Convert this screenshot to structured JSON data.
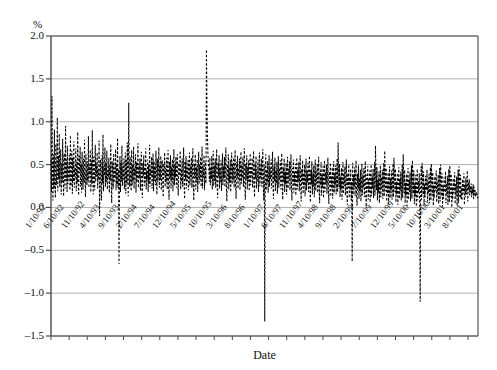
{
  "chart_data": {
    "type": "line",
    "title": "",
    "subtitle": "",
    "xlabel": "Date",
    "ylabel": "%",
    "ylim": [
      -1.5,
      2.0
    ],
    "y_ticks": [
      "2.0",
      "1.5",
      "1.0",
      "0.5",
      "0.0",
      "–0.5",
      "–1.0",
      "–1.5"
    ],
    "y_tick_values": [
      2.0,
      1.5,
      1.0,
      0.5,
      0.0,
      -0.5,
      -1.0,
      -1.5
    ],
    "grid": true,
    "grid_axis": "y",
    "legend": "none",
    "line_style": "dashed",
    "line_color": "#000000",
    "series_name": "",
    "x_tick_labels": [
      "1/10/92",
      "6/10/92",
      "11/10/92",
      "4/10/93",
      "9/10/93",
      "2/10/94",
      "7/10/94",
      "12/10/94",
      "5/10/95",
      "10/10/95",
      "3/10/96",
      "8/10/96",
      "1/10/97",
      "6/10/97",
      "11/10/97",
      "4/10/98",
      "9/10/98",
      "2/10/99",
      "7/10/99",
      "12/10/99",
      "5/10/00",
      "10/10/00",
      "3/10/01",
      "8/10/01"
    ],
    "x_tick_interval_months": 5,
    "x_range": [
      "1/10/92",
      "12/10/01"
    ],
    "n_points": 1180,
    "annotations": [
      {
        "label": "peak spike",
        "x": "3/10/96",
        "y": 1.85
      },
      {
        "label": "deep trough",
        "x": "4/10/98",
        "y": -1.33
      },
      {
        "label": "deep trough",
        "x": "3/10/01",
        "y": -1.1
      }
    ],
    "values": [
      0.55,
      0.18,
      1.3,
      0.36,
      0.08,
      0.62,
      0.22,
      0.91,
      0.3,
      0.11,
      0.74,
      0.26,
      0.44,
      1.05,
      0.19,
      0.6,
      0.33,
      0.86,
      0.24,
      0.47,
      0.68,
      0.15,
      0.52,
      0.29,
      0.8,
      0.36,
      0.13,
      0.63,
      0.41,
      0.22,
      0.95,
      0.31,
      0.56,
      0.18,
      0.72,
      0.27,
      0.49,
      0.34,
      0.61,
      0.2,
      0.84,
      0.25,
      0.43,
      0.66,
      0.16,
      0.58,
      0.3,
      0.77,
      0.23,
      0.46,
      0.35,
      0.69,
      0.19,
      0.53,
      0.28,
      0.88,
      0.32,
      0.14,
      0.6,
      0.4,
      0.71,
      0.24,
      0.5,
      0.17,
      0.65,
      0.37,
      0.21,
      0.57,
      0.29,
      0.79,
      0.33,
      0.12,
      0.62,
      0.42,
      0.26,
      0.54,
      0.31,
      0.83,
      0.23,
      0.48,
      0.38,
      0.67,
      0.18,
      0.55,
      0.27,
      0.9,
      0.34,
      0.15,
      0.59,
      0.44,
      0.2,
      0.73,
      0.3,
      0.51,
      0.36,
      0.64,
      0.22,
      0.45,
      0.32,
      0.78,
      -0.1,
      0.25,
      0.56,
      0.33,
      0.08,
      0.61,
      0.28,
      0.85,
      0.19,
      0.47,
      0.37,
      0.7,
      0.24,
      0.52,
      0.3,
      0.66,
      0.21,
      0.43,
      0.35,
      0.58,
      0.17,
      0.49,
      0.31,
      0.74,
      0.26,
      0.05,
      0.54,
      0.39,
      0.22,
      0.63,
      0.29,
      0.46,
      0.34,
      0.68,
      0.2,
      0.51,
      0.27,
      0.81,
      0.23,
      0.44,
      -0.66,
      0.36,
      0.6,
      0.18,
      0.53,
      0.3,
      0.72,
      0.25,
      0.48,
      0.33,
      0.57,
      0.21,
      0.42,
      0.64,
      0.16,
      0.55,
      0.28,
      0.76,
      0.32,
      0.13,
      1.22,
      0.45,
      0.24,
      0.59,
      0.35,
      0.19,
      0.67,
      0.26,
      0.5,
      0.31,
      0.71,
      0.22,
      0.46,
      0.38,
      0.62,
      0.17,
      0.53,
      0.29,
      0.4,
      0.75,
      0.23,
      0.48,
      0.34,
      0.57,
      0.2,
      0.44,
      0.65,
      0.27,
      0.11,
      0.52,
      0.36,
      0.61,
      0.25,
      0.47,
      0.3,
      0.69,
      0.21,
      0.43,
      0.33,
      0.56,
      0.18,
      0.5,
      0.28,
      0.73,
      0.24,
      0.45,
      0.37,
      0.59,
      0.22,
      0.41,
      0.63,
      0.19,
      0.54,
      0.31,
      0.48,
      0.26,
      0.66,
      0.35,
      0.15,
      0.57,
      0.29,
      0.44,
      0.7,
      0.23,
      0.49,
      0.32,
      0.6,
      0.2,
      0.42,
      0.55,
      0.27,
      0.12,
      0.51,
      0.38,
      0.64,
      0.24,
      0.46,
      0.3,
      0.58,
      0.21,
      0.43,
      0.67,
      0.25,
      0.09,
      0.53,
      0.34,
      0.61,
      0.22,
      0.47,
      0.31,
      0.56,
      0.19,
      0.4,
      0.68,
      0.26,
      0.5,
      0.35,
      0.59,
      0.23,
      0.44,
      0.62,
      0.28,
      0.14,
      0.52,
      0.37,
      0.48,
      0.66,
      0.21,
      0.45,
      0.3,
      0.57,
      0.24,
      0.41,
      0.7,
      0.27,
      0.1,
      0.54,
      0.33,
      0.6,
      0.22,
      0.46,
      0.31,
      0.55,
      0.2,
      0.42,
      0.64,
      0.26,
      0.49,
      0.36,
      0.58,
      0.23,
      0.44,
      0.69,
      0.25,
      0.08,
      0.51,
      0.34,
      0.62,
      0.21,
      0.47,
      0.29,
      0.56,
      0.18,
      0.43,
      0.65,
      0.27,
      0.5,
      0.32,
      0.59,
      0.24,
      0.45,
      0.71,
      0.22,
      0.48,
      0.35,
      0.61,
      0.2,
      0.42,
      0.53,
      0.28,
      1.84,
      1.2,
      0.86,
      0.63,
      0.52,
      0.44,
      0.3,
      0.58,
      0.26,
      0.47,
      0.33,
      0.6,
      0.21,
      0.43,
      0.66,
      0.25,
      0.49,
      0.31,
      0.57,
      0.23,
      0.45,
      0.68,
      0.27,
      0.11,
      0.52,
      0.36,
      0.61,
      0.22,
      0.46,
      0.3,
      0.55,
      0.19,
      0.41,
      0.63,
      0.26,
      0.48,
      0.34,
      0.59,
      0.24,
      0.44,
      0.7,
      0.25,
      0.07,
      0.5,
      0.33,
      0.62,
      0.21,
      0.47,
      0.29,
      0.56,
      0.18,
      0.43,
      0.64,
      0.27,
      0.51,
      0.32,
      0.58,
      0.23,
      0.45,
      0.67,
      0.26,
      0.1,
      0.53,
      0.35,
      0.6,
      0.22,
      0.46,
      0.31,
      0.57,
      0.2,
      0.42,
      0.65,
      0.28,
      0.49,
      0.34,
      0.59,
      0.24,
      0.44,
      0.69,
      0.25,
      0.09,
      0.51,
      0.33,
      0.61,
      0.21,
      0.47,
      0.3,
      0.55,
      0.19,
      0.4,
      0.63,
      0.26,
      0.48,
      0.36,
      0.58,
      0.23,
      0.43,
      0.66,
      0.27,
      0.12,
      0.52,
      0.34,
      0.6,
      0.22,
      0.45,
      0.31,
      0.56,
      0.18,
      0.41,
      0.64,
      0.25,
      0.49,
      0.35,
      0.57,
      0.24,
      0.46,
      0.68,
      0.26,
      0.08,
      0.5,
      -1.33,
      0.32,
      0.62,
      0.2,
      0.44,
      0.29,
      0.54,
      0.17,
      0.39,
      0.61,
      0.24,
      0.47,
      0.33,
      0.56,
      0.22,
      0.42,
      0.65,
      0.25,
      0.1,
      0.48,
      0.31,
      0.58,
      0.19,
      0.43,
      0.28,
      0.53,
      0.16,
      0.38,
      0.6,
      0.23,
      0.46,
      0.32,
      0.55,
      0.21,
      0.41,
      0.63,
      0.24,
      0.09,
      0.47,
      0.3,
      0.57,
      0.18,
      0.42,
      0.27,
      0.52,
      0.15,
      0.37,
      0.59,
      0.22,
      0.45,
      0.31,
      0.54,
      0.2,
      0.4,
      0.62,
      0.23,
      0.08,
      0.46,
      0.29,
      0.56,
      0.17,
      0.41,
      0.26,
      0.51,
      0.14,
      0.36,
      0.58,
      0.21,
      0.44,
      0.3,
      0.53,
      0.19,
      0.39,
      0.61,
      0.22,
      0.07,
      0.45,
      0.28,
      0.55,
      0.16,
      0.4,
      0.25,
      0.5,
      0.13,
      0.35,
      0.57,
      0.2,
      0.43,
      0.29,
      0.52,
      0.18,
      0.38,
      0.6,
      0.21,
      0.06,
      0.44,
      0.27,
      0.54,
      0.15,
      0.39,
      0.24,
      0.49,
      0.12,
      0.34,
      0.56,
      0.19,
      0.42,
      0.28,
      0.51,
      0.17,
      0.37,
      0.59,
      0.2,
      0.05,
      0.43,
      0.26,
      0.53,
      0.14,
      0.38,
      0.23,
      0.48,
      0.11,
      0.33,
      0.55,
      0.18,
      0.41,
      0.27,
      0.5,
      0.16,
      0.36,
      0.58,
      0.19,
      0.04,
      0.42,
      0.25,
      0.52,
      0.13,
      0.37,
      0.22,
      0.47,
      0.1,
      0.32,
      0.54,
      0.17,
      0.4,
      0.26,
      0.49,
      0.15,
      0.35,
      0.57,
      0.18,
      0.76,
      0.41,
      0.24,
      0.51,
      0.12,
      0.36,
      0.21,
      0.46,
      0.09,
      0.31,
      0.53,
      0.16,
      0.39,
      0.25,
      0.48,
      0.14,
      0.34,
      0.56,
      0.17,
      0.03,
      0.4,
      0.23,
      0.5,
      0.11,
      0.35,
      0.2,
      0.45,
      0.08,
      0.3,
      -0.63,
      0.52,
      0.15,
      0.38,
      0.24,
      0.47,
      0.13,
      0.33,
      0.55,
      0.16,
      0.02,
      0.39,
      0.22,
      0.49,
      0.1,
      0.34,
      0.19,
      0.44,
      0.07,
      0.29,
      0.51,
      0.14,
      0.37,
      0.23,
      0.46,
      0.12,
      0.32,
      0.54,
      0.15,
      0.01,
      0.38,
      0.21,
      0.48,
      0.09,
      0.33,
      0.18,
      0.43,
      0.06,
      0.28,
      0.5,
      0.13,
      0.36,
      0.22,
      0.45,
      0.11,
      0.31,
      0.53,
      0.14,
      0.72,
      0.37,
      0.2,
      0.47,
      0.08,
      0.32,
      0.17,
      0.42,
      0.05,
      0.27,
      0.49,
      0.12,
      0.35,
      0.21,
      0.44,
      0.1,
      0.3,
      0.52,
      0.13,
      0.66,
      0.36,
      0.19,
      0.46,
      0.07,
      0.31,
      0.16,
      0.41,
      0.04,
      0.26,
      0.48,
      0.11,
      0.34,
      0.2,
      0.43,
      0.09,
      0.29,
      0.51,
      0.12,
      0.58,
      0.35,
      0.18,
      0.45,
      0.06,
      0.3,
      0.15,
      0.4,
      0.03,
      0.25,
      0.47,
      0.1,
      0.33,
      0.19,
      0.42,
      0.08,
      0.28,
      0.5,
      0.11,
      0.62,
      0.34,
      0.17,
      0.44,
      0.05,
      0.29,
      0.14,
      0.39,
      0.02,
      0.24,
      0.46,
      0.09,
      0.32,
      0.18,
      0.41,
      0.07,
      0.27,
      0.49,
      0.1,
      0.55,
      0.33,
      0.16,
      0.43,
      0.04,
      0.28,
      0.13,
      0.38,
      0.01,
      0.23,
      0.45,
      0.08,
      0.31,
      0.17,
      0.4,
      0.06,
      -1.1,
      0.26,
      0.48,
      0.09,
      0.52,
      0.32,
      0.15,
      0.42,
      0.03,
      0.27,
      0.12,
      0.37,
      0.2,
      0.22,
      0.44,
      0.07,
      0.3,
      0.16,
      0.39,
      0.05,
      0.25,
      0.47,
      0.08,
      0.51,
      0.31,
      0.14,
      0.41,
      0.02,
      0.26,
      0.11,
      0.36,
      0.19,
      0.21,
      0.43,
      0.06,
      0.29,
      0.15,
      0.38,
      0.04,
      0.24,
      0.46,
      0.07,
      0.5,
      0.3,
      0.13,
      0.4,
      0.01,
      0.25,
      0.1,
      0.35,
      0.18,
      0.2,
      0.42,
      0.05,
      0.28,
      0.14,
      0.37,
      0.03,
      0.23,
      0.45,
      0.06,
      0.49,
      0.29,
      0.12,
      0.39,
      0.0,
      0.24,
      0.09,
      0.34,
      0.17,
      0.19,
      0.41,
      0.04,
      0.27,
      0.13,
      0.36,
      0.02,
      0.22,
      0.44,
      0.05,
      0.48,
      0.28,
      0.11,
      0.38,
      0.1,
      0.23,
      0.08,
      0.33,
      0.16,
      0.18,
      0.4,
      0.03,
      0.26,
      0.12,
      0.35,
      0.15,
      0.21,
      0.43,
      0.07,
      0.3,
      0.2,
      0.33,
      0.14,
      0.25,
      0.18,
      0.28,
      0.12,
      0.22,
      0.16,
      0.27,
      0.1,
      0.24,
      0.15,
      0.2,
      0.12,
      0.18,
      0.14,
      0.16,
      0.11,
      0.13
    ]
  },
  "geometry": {
    "plot_left": 51,
    "plot_right": 478,
    "plot_top": 36,
    "plot_bottom": 336
  }
}
